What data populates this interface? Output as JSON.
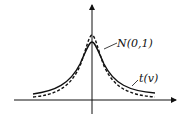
{
  "diagram": {
    "title": "",
    "labels": {
      "normal": "N(0,1)",
      "t": "t(v)"
    },
    "curves": [
      {
        "name": "N(0,1)",
        "style": "dashed"
      },
      {
        "name": "t(v)",
        "style": "solid"
      }
    ],
    "colors": {
      "line": "#111111",
      "background": "#ffffff"
    }
  }
}
